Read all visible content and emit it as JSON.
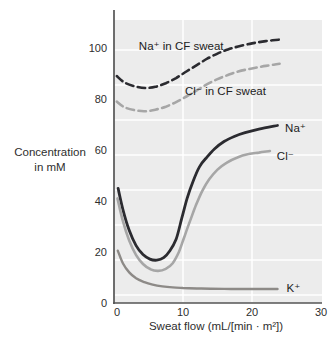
{
  "figure": {
    "background": "#ffffff",
    "description_texts": {
      "y_axis_label_line1": "Concentration",
      "y_axis_label_line2": "in mM",
      "x_axis_label": "Sweat flow (mL/[min · m²])"
    }
  },
  "chart_data": {
    "type": "line",
    "title": "",
    "xlabel": "Sweat flow (mL/[min · m²])",
    "ylabel": "Concentration in mM",
    "ylabel_lines": [
      "Concentration",
      "in mM"
    ],
    "xlim": [
      0,
      30
    ],
    "ylim": [
      0,
      115
    ],
    "xticks": [
      0,
      10,
      20,
      30
    ],
    "yticks": [
      0,
      20,
      40,
      60,
      80,
      100
    ],
    "grid": true,
    "legend_position": "inline-annotations",
    "colors": {
      "plot_background": "#ececec",
      "gridline": "#ffffff",
      "axis": "#555555",
      "sodium": "#2b2b30",
      "chloride": "#a6a6a6",
      "potassium": "#8d8a87",
      "label_text": "#222222"
    },
    "series": [
      {
        "id": "na-cf-sweat",
        "name": "Na⁺ in CF sweat",
        "line_style": "dashed",
        "color": "#2b2b30",
        "points": [
          [
            0.4,
            89
          ],
          [
            1.5,
            86.5
          ],
          [
            3,
            85
          ],
          [
            4.5,
            84.3
          ],
          [
            6,
            84.8
          ],
          [
            7.5,
            86.2
          ],
          [
            9,
            88.2
          ],
          [
            10.5,
            90.8
          ],
          [
            12,
            93.3
          ],
          [
            13.5,
            95.8
          ],
          [
            15,
            97.8
          ],
          [
            16.5,
            99.4
          ],
          [
            18,
            100.6
          ],
          [
            20,
            101.8
          ],
          [
            22,
            102.7
          ],
          [
            24.4,
            103.4
          ]
        ]
      },
      {
        "id": "cl-cf-sweat",
        "name": "Cl⁻ in CF sweat",
        "line_style": "dashed",
        "color": "#a6a6a6",
        "points": [
          [
            0.4,
            79
          ],
          [
            1.5,
            76.8
          ],
          [
            3,
            75.6
          ],
          [
            4.5,
            75.2
          ],
          [
            6,
            75.8
          ],
          [
            7.5,
            77
          ],
          [
            9,
            78.8
          ],
          [
            10.5,
            81
          ],
          [
            12,
            83.4
          ],
          [
            13.5,
            85.8
          ],
          [
            15,
            87.8
          ],
          [
            16.5,
            89.4
          ],
          [
            18,
            90.8
          ],
          [
            20,
            92
          ],
          [
            22,
            93
          ],
          [
            24,
            93.8
          ]
        ]
      },
      {
        "id": "na-normal",
        "name": "Na⁺",
        "line_style": "solid",
        "color": "#2b2b30",
        "points": [
          [
            0.6,
            45
          ],
          [
            1.3,
            36.5
          ],
          [
            2.2,
            28.5
          ],
          [
            3.2,
            22.5
          ],
          [
            4.2,
            19
          ],
          [
            5.2,
            17.2
          ],
          [
            6.2,
            16.8
          ],
          [
            7.2,
            17.8
          ],
          [
            8.1,
            20.5
          ],
          [
            9,
            25
          ],
          [
            9.8,
            33
          ],
          [
            10.6,
            41
          ],
          [
            11.5,
            48
          ],
          [
            12.4,
            53.5
          ],
          [
            13.4,
            57
          ],
          [
            14.6,
            60.5
          ],
          [
            16,
            63.4
          ],
          [
            17.5,
            65.4
          ],
          [
            19,
            66.8
          ],
          [
            21,
            68.2
          ],
          [
            23.7,
            69.6
          ]
        ]
      },
      {
        "id": "cl-normal",
        "name": "Cl⁻",
        "line_style": "solid",
        "color": "#a6a6a6",
        "points": [
          [
            0.5,
            41
          ],
          [
            1.3,
            32
          ],
          [
            2.2,
            24.5
          ],
          [
            3.2,
            18.8
          ],
          [
            4.2,
            15.3
          ],
          [
            5.3,
            13.2
          ],
          [
            6.4,
            12.6
          ],
          [
            7.5,
            13.4
          ],
          [
            8.5,
            15.6
          ],
          [
            9.4,
            20
          ],
          [
            10.2,
            26
          ],
          [
            11,
            32
          ],
          [
            11.9,
            38.5
          ],
          [
            12.8,
            44
          ],
          [
            13.8,
            48.5
          ],
          [
            15,
            52.3
          ],
          [
            16.3,
            55
          ],
          [
            17.8,
            57
          ],
          [
            19.5,
            58.4
          ],
          [
            21,
            59
          ],
          [
            22.6,
            59.6
          ]
        ]
      },
      {
        "id": "k-normal",
        "name": "K⁺",
        "line_style": "solid",
        "color": "#8d8a87",
        "points": [
          [
            0.55,
            20.5
          ],
          [
            1.3,
            15.5
          ],
          [
            2.2,
            12
          ],
          [
            3.2,
            9.7
          ],
          [
            4.4,
            8.2
          ],
          [
            5.6,
            7.2
          ],
          [
            7,
            6.5
          ],
          [
            8.5,
            6.1
          ],
          [
            10,
            5.9
          ],
          [
            12,
            5.7
          ],
          [
            14,
            5.6
          ],
          [
            17,
            5.5
          ],
          [
            20,
            5.5
          ],
          [
            23.7,
            5.5
          ]
        ]
      }
    ],
    "annotations": [
      {
        "id": "na-cf-sweat",
        "text": "Na⁺ in CF sweat",
        "x": 3.6,
        "y": 100.8
      },
      {
        "id": "cl-cf-sweat",
        "text": "Cl⁻ in CF sweat",
        "x": 10.3,
        "y": 83.2
      },
      {
        "id": "na-normal",
        "text": "Na⁺",
        "x": 24.8,
        "y": 68.8
      },
      {
        "id": "cl-normal",
        "text": "Cl⁻",
        "x": 23.6,
        "y": 57.7
      },
      {
        "id": "k-normal",
        "text": "K⁺",
        "x": 25.0,
        "y": 5.8
      }
    ]
  }
}
